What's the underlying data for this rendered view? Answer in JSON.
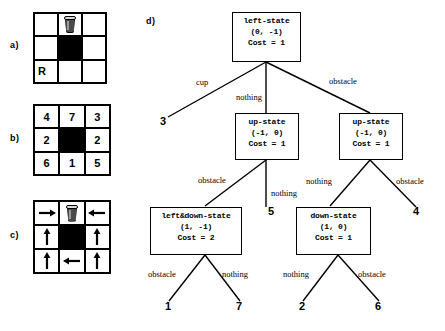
{
  "panels": {
    "a": {
      "label": "a)"
    },
    "b": {
      "label": "b)"
    },
    "c": {
      "label": "c)"
    },
    "d": {
      "label": "d)"
    }
  },
  "grid_a": {
    "cells": [
      {
        "kind": "empty",
        "text": ""
      },
      {
        "kind": "cup",
        "text": ""
      },
      {
        "kind": "empty",
        "text": ""
      },
      {
        "kind": "empty",
        "text": ""
      },
      {
        "kind": "black",
        "text": ""
      },
      {
        "kind": "empty",
        "text": ""
      },
      {
        "kind": "text",
        "text": "R"
      },
      {
        "kind": "empty",
        "text": ""
      },
      {
        "kind": "empty",
        "text": ""
      }
    ]
  },
  "grid_b": {
    "cells": [
      {
        "kind": "text",
        "text": "4"
      },
      {
        "kind": "text",
        "text": "7"
      },
      {
        "kind": "text",
        "text": "3"
      },
      {
        "kind": "text",
        "text": "2"
      },
      {
        "kind": "black",
        "text": ""
      },
      {
        "kind": "text",
        "text": "2"
      },
      {
        "kind": "text",
        "text": "6"
      },
      {
        "kind": "text",
        "text": "1"
      },
      {
        "kind": "text",
        "text": "5"
      }
    ]
  },
  "grid_c": {
    "cells": [
      {
        "kind": "arrow",
        "dir": "right"
      },
      {
        "kind": "cup",
        "dir": ""
      },
      {
        "kind": "arrow",
        "dir": "left"
      },
      {
        "kind": "arrow",
        "dir": "up"
      },
      {
        "kind": "black",
        "dir": ""
      },
      {
        "kind": "arrow",
        "dir": "up"
      },
      {
        "kind": "arrow",
        "dir": "up"
      },
      {
        "kind": "arrow",
        "dir": "left"
      },
      {
        "kind": "arrow",
        "dir": "up"
      }
    ]
  },
  "tree": {
    "nodes": {
      "root": {
        "name": "left-state",
        "coord": "(0, -1)",
        "cost": "Cost = 1"
      },
      "up_mid": {
        "name": "up-state",
        "coord": "(-1, 0)",
        "cost": "Cost = 1"
      },
      "up_right": {
        "name": "up-state",
        "coord": "(-1, 0)",
        "cost": "Cost = 1"
      },
      "leftdown": {
        "name": "left&down-state",
        "coord": "(1, -1)",
        "cost": "Cost = 2"
      },
      "down": {
        "name": "down-state",
        "coord": "(1, 0)",
        "cost": "Cost = 1"
      }
    },
    "edge_labels": {
      "root_cup": "cup",
      "root_nothing": "nothing",
      "root_obstacle": "obstacle",
      "upmid_obstacle": "obstacle",
      "upmid_nothing": "nothing",
      "upright_nothing": "nothing",
      "upright_obstacle": "obstacle",
      "leftdown_obstacle": "obstacle",
      "leftdown_nothing": "nothing",
      "down_nothing": "nothing",
      "down_obstacle": "obstacle"
    },
    "leaves": {
      "l3": "3",
      "l5": "5",
      "l4": "4",
      "l1": "1",
      "l7": "7",
      "l2": "2",
      "l6": "6"
    }
  },
  "colors": {
    "ink": "#000000",
    "obstacle": "#000000",
    "cup_body": "#4a4a4a",
    "cup_rim": "#d8d8d8",
    "paper": "#ffffff"
  }
}
